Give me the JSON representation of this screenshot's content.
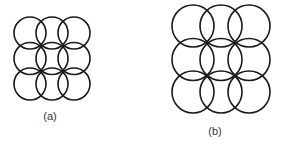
{
  "figures": [
    {
      "id": "a",
      "label": "(a)",
      "radius": 16,
      "columns_x": [
        30,
        52,
        74
      ],
      "rows_y": [
        33,
        58.5,
        84
      ],
      "label_pos": [
        50,
        120
      ]
    },
    {
      "id": "b",
      "label": "(b)",
      "radius": 21,
      "columns_x": [
        193,
        221,
        249
      ],
      "rows_y": [
        26,
        59.5,
        92
      ],
      "label_pos": [
        215,
        135
      ]
    }
  ],
  "style": {
    "stroke": "#1a1a1a",
    "background": "#ffffff",
    "label_color": "#333333"
  }
}
